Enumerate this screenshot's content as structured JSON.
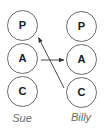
{
  "diagram": {
    "type": "ego-state transaction diagram",
    "columns": [
      {
        "person": "Sue",
        "states": [
          {
            "id": "sue-p",
            "label": "P"
          },
          {
            "id": "sue-a",
            "label": "A"
          },
          {
            "id": "sue-c",
            "label": "C"
          }
        ]
      },
      {
        "person": "Billy",
        "states": [
          {
            "id": "billy-p",
            "label": "P"
          },
          {
            "id": "billy-a",
            "label": "A"
          },
          {
            "id": "billy-c",
            "label": "C"
          }
        ]
      }
    ],
    "arrows": [
      {
        "from": "sue-a",
        "to": "billy-a",
        "direction": "horizontal"
      },
      {
        "from": "billy-c",
        "to": "sue-p",
        "direction": "diagonal"
      }
    ],
    "colors": {
      "stroke": "#6b6b6b",
      "arrow": "#333333",
      "state_text": "#1a1a1a",
      "name_text": "#6a6a6a",
      "background": "#ffffff"
    }
  }
}
